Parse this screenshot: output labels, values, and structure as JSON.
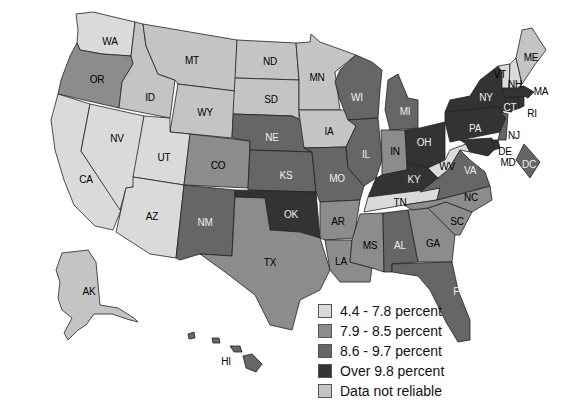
{
  "legend": {
    "items": [
      {
        "label": "4.4 - 7.8 percent",
        "color": "#dadada"
      },
      {
        "label": "7.9 - 8.5 percent",
        "color": "#8c8c8c"
      },
      {
        "label": "8.6 - 9.7 percent",
        "color": "#666666"
      },
      {
        "label": "Over 9.8 percent",
        "color": "#333333"
      },
      {
        "label": "Data not reliable",
        "color": "#c4c4c4"
      }
    ]
  },
  "states": {
    "WA": {
      "label": "WA",
      "category": 0
    },
    "OR": {
      "label": "OR",
      "category": 1
    },
    "CA": {
      "label": "CA",
      "category": 0
    },
    "NV": {
      "label": "NV",
      "category": 0
    },
    "ID": {
      "label": "ID",
      "category": 4
    },
    "MT": {
      "label": "MT",
      "category": 4
    },
    "WY": {
      "label": "WY",
      "category": 4
    },
    "UT": {
      "label": "UT",
      "category": 0
    },
    "AZ": {
      "label": "AZ",
      "category": 0
    },
    "CO": {
      "label": "CO",
      "category": 1
    },
    "NM": {
      "label": "NM",
      "category": 2
    },
    "ND": {
      "label": "ND",
      "category": 4
    },
    "SD": {
      "label": "SD",
      "category": 4
    },
    "NE": {
      "label": "NE",
      "category": 2
    },
    "KS": {
      "label": "KS",
      "category": 2
    },
    "OK": {
      "label": "OK",
      "category": 3
    },
    "TX": {
      "label": "TX",
      "category": 1
    },
    "MN": {
      "label": "MN",
      "category": 4
    },
    "IA": {
      "label": "IA",
      "category": 4
    },
    "MO": {
      "label": "MO",
      "category": 2
    },
    "AR": {
      "label": "AR",
      "category": 1
    },
    "LA": {
      "label": "LA",
      "category": 1
    },
    "WI": {
      "label": "WI",
      "category": 2
    },
    "IL": {
      "label": "IL",
      "category": 2
    },
    "MI": {
      "label": "MI",
      "category": 2
    },
    "IN": {
      "label": "IN",
      "category": 1
    },
    "OH": {
      "label": "OH",
      "category": 3
    },
    "KY": {
      "label": "KY",
      "category": 3
    },
    "TN": {
      "label": "TN",
      "category": 0
    },
    "MS": {
      "label": "MS",
      "category": 1
    },
    "AL": {
      "label": "AL",
      "category": 2
    },
    "GA": {
      "label": "GA",
      "category": 1
    },
    "FL": {
      "label": "FL",
      "category": 2
    },
    "SC": {
      "label": "SC",
      "category": 1
    },
    "NC": {
      "label": "NC",
      "category": 1
    },
    "VA": {
      "label": "VA",
      "category": 2
    },
    "WV": {
      "label": "WV",
      "category": 0
    },
    "PA": {
      "label": "PA",
      "category": 3
    },
    "NY": {
      "label": "NY",
      "category": 3
    },
    "NJ": {
      "label": "NJ",
      "category": 2
    },
    "DE": {
      "label": "DE",
      "category": 3
    },
    "MD": {
      "label": "MD",
      "category": 3
    },
    "DC": {
      "label": "DC",
      "category": 2
    },
    "CT": {
      "label": "CT",
      "category": 3
    },
    "RI": {
      "label": "RI",
      "category": 3
    },
    "MA": {
      "label": "MA",
      "category": 3
    },
    "VT": {
      "label": "VT",
      "category": 0
    },
    "NH": {
      "label": "NH",
      "category": 0
    },
    "ME": {
      "label": "ME",
      "category": 4
    },
    "AK": {
      "label": "AK",
      "category": 4
    },
    "HI": {
      "label": "HI",
      "category": 2
    }
  }
}
